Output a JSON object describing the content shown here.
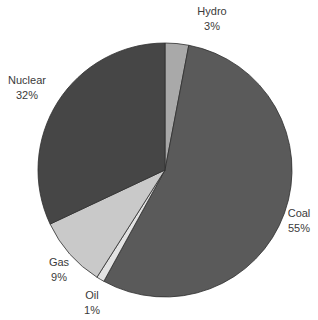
{
  "chart_data": {
    "type": "pie",
    "title": "",
    "start_angle_deg": 0,
    "direction": "clockwise",
    "slices": [
      {
        "name": "Hydro",
        "value": 3,
        "label": "Hydro",
        "pct_label": "3%",
        "color": "#a9a9a9"
      },
      {
        "name": "Coal",
        "value": 55,
        "label": "Coal",
        "pct_label": "55%",
        "color": "#5a5a5a"
      },
      {
        "name": "Oil",
        "value": 1,
        "label": "Oil",
        "pct_label": "1%",
        "color": "#e2e2e2"
      },
      {
        "name": "Gas",
        "value": 9,
        "label": "Gas",
        "pct_label": "9%",
        "color": "#c9c9c9"
      },
      {
        "name": "Nuclear",
        "value": 32,
        "label": "Nuclear",
        "pct_label": "32%",
        "color": "#464646"
      }
    ],
    "categories": [
      "Hydro",
      "Coal",
      "Oil",
      "Gas",
      "Nuclear"
    ],
    "values": [
      3,
      55,
      1,
      9,
      32
    ],
    "legend": "none (direct labels)"
  },
  "labels": {
    "hydro": {
      "name": "Hydro",
      "pct": "3%"
    },
    "coal": {
      "name": "Coal",
      "pct": "55%"
    },
    "oil": {
      "name": "Oil",
      "pct": "1%"
    },
    "gas": {
      "name": "Gas",
      "pct": "9%"
    },
    "nuclear": {
      "name": "Nuclear",
      "pct": "32%"
    }
  }
}
